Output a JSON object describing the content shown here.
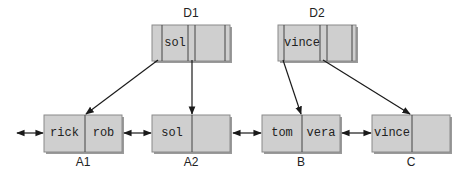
{
  "colors": {
    "box_fill": "#cfcfcf",
    "box_shadow": "#9a9a9a",
    "line": "#1a1a1a"
  },
  "directory_nodes": [
    {
      "label": "D1",
      "keys": [
        "sol"
      ]
    },
    {
      "label": "D2",
      "keys": [
        "vince"
      ]
    }
  ],
  "leaf_nodes": [
    {
      "label": "A1",
      "keys": [
        "rick",
        "rob"
      ]
    },
    {
      "label": "A2",
      "keys": [
        "sol",
        ""
      ]
    },
    {
      "label": "B",
      "keys": [
        "tom",
        "vera"
      ]
    },
    {
      "label": "C",
      "keys": [
        "vince",
        ""
      ]
    }
  ]
}
